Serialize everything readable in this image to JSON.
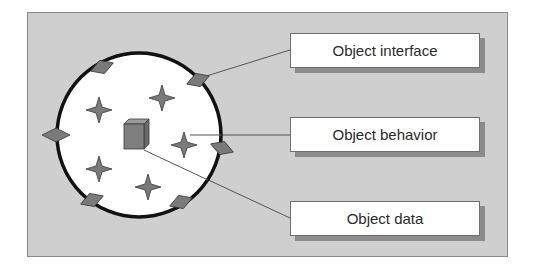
{
  "diagram": {
    "title": "",
    "labels": [
      {
        "id": "interface",
        "text": "Object interface"
      },
      {
        "id": "behavior",
        "text": "Object behavior"
      },
      {
        "id": "data",
        "text": "Object data"
      }
    ],
    "colors": {
      "background": "#cfcfcf",
      "circle_fill": "#ffffff",
      "circle_stroke": "#111111",
      "shape_fill": "#7a7a7a",
      "label_fill": "#ffffff",
      "connector": "#555555"
    },
    "elements": {
      "circle": "object boundary",
      "diamonds_on_boundary": 7,
      "stars_inside": 6,
      "cube_center": 1
    }
  }
}
